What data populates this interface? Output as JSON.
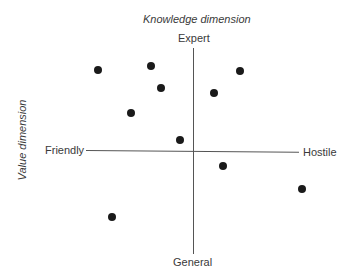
{
  "diagram": {
    "title_top": "Knowledge dimension",
    "title_left": "Value dimension",
    "vertical_axis": {
      "top_label": "Expert",
      "bottom_label": "General"
    },
    "horizontal_axis": {
      "left_label": "Friendly",
      "right_label": "Hostile"
    },
    "colors": {
      "axis": "#555555",
      "dot": "#1a1a1a",
      "text": "#3a3a3a"
    },
    "points": [
      {
        "x": 98,
        "y": 70
      },
      {
        "x": 151,
        "y": 66
      },
      {
        "x": 161,
        "y": 88
      },
      {
        "x": 131,
        "y": 113
      },
      {
        "x": 240,
        "y": 71
      },
      {
        "x": 214,
        "y": 93
      },
      {
        "x": 180,
        "y": 140
      },
      {
        "x": 223,
        "y": 166
      },
      {
        "x": 302,
        "y": 189
      },
      {
        "x": 112,
        "y": 217
      }
    ]
  }
}
